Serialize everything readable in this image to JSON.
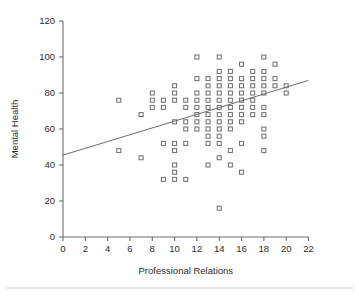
{
  "figure": {
    "background": "#ffffff",
    "marker_color": "#6a6a72",
    "axis_color": "#6e6e6e",
    "text_color": "#2b2b2b",
    "rule_color": "#cfcfcf"
  },
  "chart_data": {
    "type": "scatter",
    "title": "",
    "xlabel": "Professional Relations",
    "ylabel": "Mental Health",
    "xlim": [
      0,
      22
    ],
    "ylim": [
      0,
      120
    ],
    "xticks": [
      0,
      2,
      4,
      6,
      8,
      10,
      12,
      14,
      16,
      18,
      20,
      22
    ],
    "yticks": [
      0,
      20,
      40,
      60,
      80,
      100,
      120
    ],
    "xtick_labels": [
      "0",
      "2",
      "4",
      "6",
      "8",
      "10",
      "12",
      "14",
      "16",
      "18",
      "20",
      "22"
    ],
    "ytick_labels": [
      "0",
      "20",
      "40",
      "60",
      "80",
      "100",
      "120"
    ],
    "grid": false,
    "legend": null,
    "marker_shape": "open-square",
    "points": [
      [
        5,
        76
      ],
      [
        5,
        48
      ],
      [
        7,
        68
      ],
      [
        7,
        44
      ],
      [
        8,
        80
      ],
      [
        8,
        76
      ],
      [
        8,
        72
      ],
      [
        9,
        76
      ],
      [
        9,
        72
      ],
      [
        9,
        52
      ],
      [
        9,
        32
      ],
      [
        10,
        84
      ],
      [
        10,
        80
      ],
      [
        10,
        76
      ],
      [
        10,
        64
      ],
      [
        10,
        52
      ],
      [
        10,
        48
      ],
      [
        10,
        40
      ],
      [
        10,
        36
      ],
      [
        10,
        32
      ],
      [
        11,
        76
      ],
      [
        11,
        72
      ],
      [
        11,
        64
      ],
      [
        11,
        60
      ],
      [
        11,
        52
      ],
      [
        11,
        32
      ],
      [
        12,
        100
      ],
      [
        12,
        88
      ],
      [
        12,
        80
      ],
      [
        12,
        76
      ],
      [
        12,
        72
      ],
      [
        12,
        68
      ],
      [
        12,
        64
      ],
      [
        12,
        60
      ],
      [
        13,
        88
      ],
      [
        13,
        84
      ],
      [
        13,
        80
      ],
      [
        13,
        76
      ],
      [
        13,
        72
      ],
      [
        13,
        68
      ],
      [
        13,
        64
      ],
      [
        13,
        60
      ],
      [
        13,
        56
      ],
      [
        13,
        52
      ],
      [
        13,
        40
      ],
      [
        14,
        100
      ],
      [
        14,
        92
      ],
      [
        14,
        88
      ],
      [
        14,
        84
      ],
      [
        14,
        80
      ],
      [
        14,
        76
      ],
      [
        14,
        72
      ],
      [
        14,
        68
      ],
      [
        14,
        64
      ],
      [
        14,
        60
      ],
      [
        14,
        56
      ],
      [
        14,
        52
      ],
      [
        14,
        44
      ],
      [
        14,
        16
      ],
      [
        15,
        92
      ],
      [
        15,
        88
      ],
      [
        15,
        84
      ],
      [
        15,
        80
      ],
      [
        15,
        76
      ],
      [
        15,
        72
      ],
      [
        15,
        68
      ],
      [
        15,
        64
      ],
      [
        15,
        60
      ],
      [
        15,
        48
      ],
      [
        15,
        40
      ],
      [
        16,
        96
      ],
      [
        16,
        88
      ],
      [
        16,
        84
      ],
      [
        16,
        80
      ],
      [
        16,
        76
      ],
      [
        16,
        72
      ],
      [
        16,
        68
      ],
      [
        16,
        64
      ],
      [
        16,
        52
      ],
      [
        16,
        36
      ],
      [
        17,
        92
      ],
      [
        17,
        88
      ],
      [
        17,
        84
      ],
      [
        17,
        80
      ],
      [
        17,
        76
      ],
      [
        17,
        72
      ],
      [
        17,
        68
      ],
      [
        18,
        100
      ],
      [
        18,
        92
      ],
      [
        18,
        88
      ],
      [
        18,
        84
      ],
      [
        18,
        80
      ],
      [
        18,
        72
      ],
      [
        18,
        68
      ],
      [
        18,
        60
      ],
      [
        18,
        56
      ],
      [
        18,
        48
      ],
      [
        19,
        96
      ],
      [
        19,
        88
      ],
      [
        19,
        84
      ],
      [
        20,
        84
      ],
      [
        20,
        80
      ]
    ],
    "trendline": {
      "x_start": 0,
      "y_start": 45.5,
      "x_end": 22,
      "y_end": 87.0
    }
  }
}
